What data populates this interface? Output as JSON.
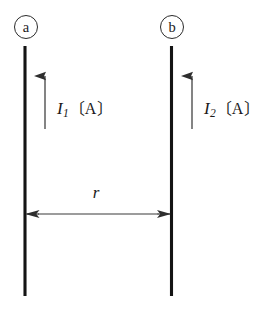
{
  "figure": {
    "kind": "physics-diagram",
    "background_color": "#ffffff",
    "ink_color": "#1a1a1a",
    "wire_color": "#141414",
    "arrow_color": "#3a3a3a",
    "conductors": [
      {
        "id": "a",
        "badge": "ⓐ",
        "badge_letter": "a",
        "current_symbol": "I",
        "current_subscript": "1",
        "current_unit_open": "〔",
        "current_unit": "A",
        "current_unit_close": "〕",
        "current_label_full": "I₁〔A〕",
        "current_direction": "up"
      },
      {
        "id": "b",
        "badge": "ⓑ",
        "badge_letter": "b",
        "current_symbol": "I",
        "current_subscript": "2",
        "current_unit_open": "〔",
        "current_unit": "A",
        "current_unit_close": "〕",
        "current_label_full": "I₂〔A〕",
        "current_direction": "up"
      }
    ],
    "separation": {
      "symbol": "r",
      "arrow_style": "double-headed",
      "orientation": "horizontal"
    }
  }
}
